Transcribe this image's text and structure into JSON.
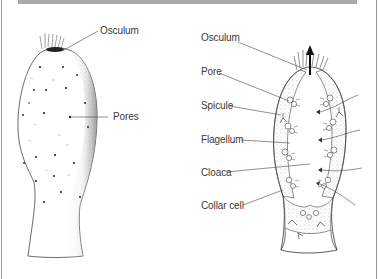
{
  "diagram": {
    "left_figure": {
      "name": "sponge-exterior",
      "labels": [
        {
          "id": "osculum",
          "text": "Osculum"
        },
        {
          "id": "pores",
          "text": "Pores"
        }
      ]
    },
    "right_figure": {
      "name": "sponge-cross-section",
      "labels": [
        {
          "id": "osculum",
          "text": "Osculum"
        },
        {
          "id": "pore",
          "text": "Pore"
        },
        {
          "id": "spicule",
          "text": "Spicule"
        },
        {
          "id": "flagellum",
          "text": "Flagellum"
        },
        {
          "id": "cloaca",
          "text": "Cloaca"
        },
        {
          "id": "collar-cell",
          "text": "Collar cell"
        }
      ]
    },
    "colors": {
      "header_band": "#a9a9a9",
      "border": "#9a9a9a",
      "ink": "#333333",
      "label_text": "#3a3a3a"
    }
  }
}
